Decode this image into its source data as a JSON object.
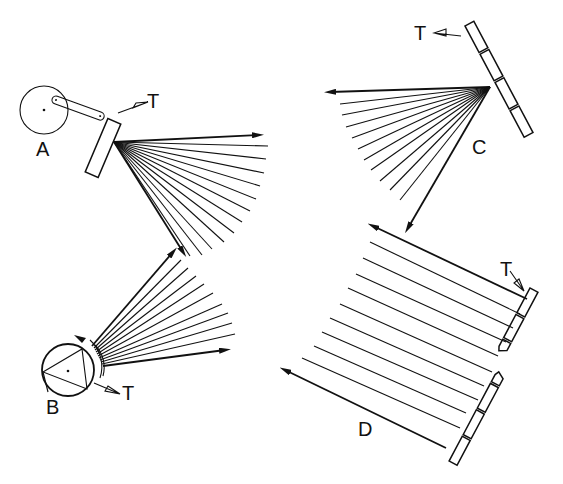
{
  "figure": {
    "panels": [
      {
        "id": "A",
        "label": "A",
        "transducer_label": "T",
        "type": "crank-driven oscillating mirror"
      },
      {
        "id": "B",
        "label": "B",
        "transducer_label": "T",
        "type": "rotating polygon (triangular) mirror"
      },
      {
        "id": "C",
        "label": "C",
        "transducer_label": "T",
        "type": "segmented mirror, common focus fan"
      },
      {
        "id": "D",
        "label": "D",
        "transducer_label": "T",
        "type": "segmented linear array, parallel beams"
      }
    ],
    "caption_visible": false
  },
  "colors": {
    "ink": "#111111",
    "background": "#ffffff"
  }
}
